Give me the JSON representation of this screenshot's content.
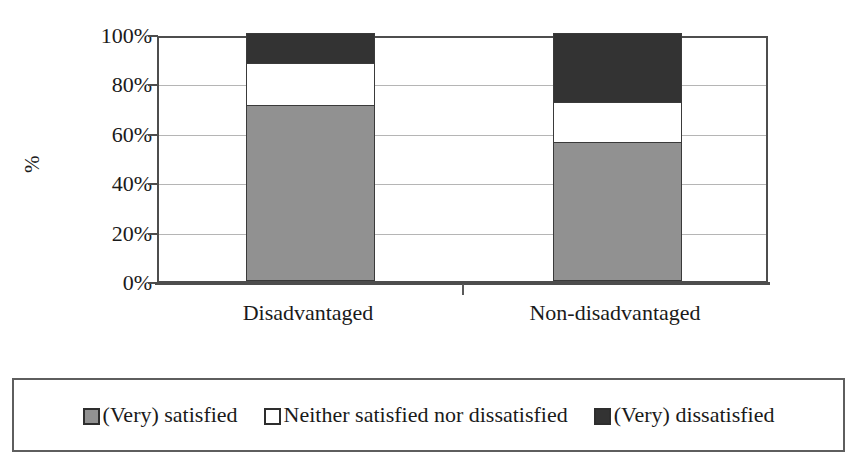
{
  "chart_data": {
    "type": "bar",
    "subtype": "stacked-100-percent",
    "title": "",
    "xlabel": "",
    "ylabel": "%",
    "ylim": [
      0,
      100
    ],
    "ytick_labels": [
      "100%",
      "80%",
      "60%",
      "40%",
      "20%",
      "0%"
    ],
    "ytick_values": [
      100,
      80,
      60,
      40,
      20,
      0
    ],
    "grid": true,
    "grid_axis": "y",
    "legend_position": "bottom",
    "categories": [
      "Disadvantaged",
      "Non-disadvantaged"
    ],
    "series": [
      {
        "name": "(Very) satisfied",
        "color": "#919191",
        "values": [
          71,
          56
        ]
      },
      {
        "name": "Neither satisfied nor dissatisfied",
        "color": "#ffffff",
        "values": [
          17,
          16
        ]
      },
      {
        "name": "(Very) dissatisfied",
        "color": "#333333",
        "values": [
          12,
          28
        ]
      }
    ]
  },
  "axis": {
    "y_title": "%",
    "y_ticks": [
      {
        "label": "100%",
        "value": 100
      },
      {
        "label": "80%",
        "value": 80
      },
      {
        "label": "60%",
        "value": 60
      },
      {
        "label": "40%",
        "value": 40
      },
      {
        "label": "20%",
        "value": 20
      },
      {
        "label": "0%",
        "value": 0
      }
    ]
  },
  "legend": {
    "items": [
      {
        "label": "(Very) satisfied",
        "color": "#919191"
      },
      {
        "label": "Neither satisfied nor dissatisfied",
        "color": "#ffffff"
      },
      {
        "label": "(Very) dissatisfied",
        "color": "#333333"
      }
    ]
  },
  "colors": {
    "satisfied": "#919191",
    "neutral": "#ffffff",
    "dissatisfied": "#333333",
    "frame": "#4d4d4d",
    "grid": "#b5b5b5",
    "segment_border": "#3a3a3a"
  }
}
